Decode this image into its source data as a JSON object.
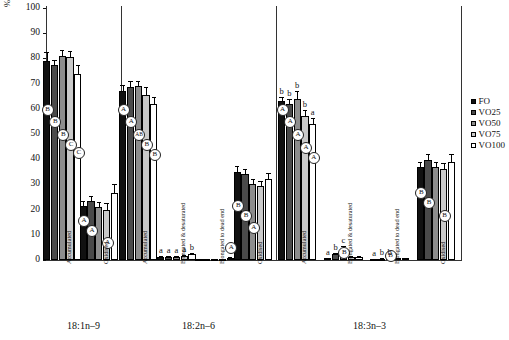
{
  "chart_data": {
    "type": "bar",
    "title": "",
    "xlabel": "",
    "ylabel": "% of relative net intake",
    "ylim": [
      0,
      100
    ],
    "yticks": [
      0,
      10,
      20,
      30,
      40,
      50,
      60,
      70,
      80,
      90,
      100
    ],
    "grid": false,
    "legend_position": "right",
    "legend": [
      "FO",
      "VO25",
      "VO50",
      "VO75",
      "VO100"
    ],
    "series_colors": {
      "FO": "#111111",
      "VO25": "#4a4a4a",
      "VO50": "#8d8d8d",
      "VO75": "#c9c9c9",
      "VO100": "#ffffff"
    },
    "group_labels": [
      "18:1n–9",
      "18:2n–6",
      "18:3n–3"
    ],
    "categories": [
      {
        "group": "18:1n–9",
        "label": "Accumulated"
      },
      {
        "group": "18:1n–9",
        "label": "Oxidised"
      },
      {
        "group": "18:2n–6",
        "label": "Accumulated"
      },
      {
        "group": "18:2n–6",
        "label": "Elongated & desaturated"
      },
      {
        "group": "18:2n–6",
        "label": "Elongated to dead end"
      },
      {
        "group": "18:2n–6",
        "label": "Oxidised"
      },
      {
        "group": "18:3n–3",
        "label": "Accumulated"
      },
      {
        "group": "18:3n–3",
        "label": "Elongated & desaturated"
      },
      {
        "group": "18:3n–3",
        "label": "Elongated to dead end"
      },
      {
        "group": "18:3n–3",
        "label": "Oxidised"
      }
    ],
    "series": [
      {
        "name": "FO",
        "values": [
          79.0,
          21.5,
          67.0,
          1.2,
          0.3,
          35.0,
          63.0,
          0.6,
          0.3,
          37.0
        ]
      },
      {
        "name": "VO25",
        "values": [
          77.5,
          23.5,
          68.5,
          1.3,
          0.3,
          34.0,
          62.0,
          2.2,
          0.5,
          39.5
        ]
      },
      {
        "name": "VO50",
        "values": [
          81.0,
          21.0,
          69.0,
          1.3,
          0.3,
          30.0,
          64.0,
          4.5,
          0.6,
          37.0
        ]
      },
      {
        "name": "VO75",
        "values": [
          80.5,
          20.0,
          65.5,
          1.4,
          0.3,
          29.5,
          57.0,
          1.0,
          0.6,
          36.0
        ]
      },
      {
        "name": "VO100",
        "values": [
          74.0,
          26.5,
          62.0,
          2.2,
          0.8,
          32.0,
          54.0,
          1.0,
          0.6,
          39.0
        ]
      }
    ],
    "errors": [
      {
        "name": "FO",
        "values": [
          3.5,
          2.0,
          2.5,
          0.4,
          0.1,
          2.5,
          1.5,
          0.3,
          0.1,
          2.0
        ]
      },
      {
        "name": "VO25",
        "values": [
          2.0,
          2.0,
          2.5,
          0.4,
          0.1,
          2.0,
          2.0,
          0.6,
          0.2,
          2.5
        ]
      },
      {
        "name": "VO50",
        "values": [
          2.5,
          2.0,
          2.0,
          0.4,
          0.1,
          2.0,
          3.0,
          1.2,
          0.2,
          2.0
        ]
      },
      {
        "name": "VO75",
        "values": [
          2.5,
          2.5,
          3.0,
          0.4,
          0.1,
          2.0,
          2.5,
          0.4,
          0.2,
          2.5
        ]
      },
      {
        "name": "VO100",
        "values": [
          3.5,
          3.5,
          2.5,
          0.5,
          0.2,
          2.5,
          2.5,
          0.4,
          0.2,
          3.0
        ]
      }
    ],
    "circle_annotations": [
      {
        "category": 0,
        "marks": [
          {
            "series": "FO",
            "text": "B",
            "y": 60
          },
          {
            "series": "VO25",
            "text": "B",
            "y": 55
          },
          {
            "series": "VO50",
            "text": "B",
            "y": 50
          },
          {
            "series": "VO75",
            "text": "C",
            "y": 46
          },
          {
            "series": "VO100",
            "text": "C",
            "y": 43
          }
        ]
      },
      {
        "category": 1,
        "marks": [
          {
            "series": "FO",
            "text": "A",
            "y": 16
          },
          {
            "series": "VO25",
            "text": "A",
            "y": 12
          },
          {
            "series": "VO50",
            "text": "",
            "y": 0
          },
          {
            "series": "VO75",
            "text": "A",
            "y": 7
          },
          {
            "series": "VO100",
            "text": "",
            "y": 0
          }
        ]
      },
      {
        "category": 2,
        "marks": [
          {
            "series": "FO",
            "text": "A",
            "y": 60
          },
          {
            "series": "VO25",
            "text": "A",
            "y": 55
          },
          {
            "series": "VO50",
            "text": "AB",
            "y": 50
          },
          {
            "series": "VO75",
            "text": "B",
            "y": 46
          },
          {
            "series": "VO100",
            "text": "B",
            "y": 42
          }
        ]
      },
      {
        "category": 4,
        "marks": [
          {
            "series": "VO100",
            "text": "A",
            "y": 5
          }
        ]
      },
      {
        "category": 5,
        "marks": [
          {
            "series": "FO",
            "text": "B",
            "y": 22
          },
          {
            "series": "VO25",
            "text": "B",
            "y": 18
          },
          {
            "series": "VO50",
            "text": "A",
            "y": 13
          }
        ]
      },
      {
        "category": 6,
        "marks": [
          {
            "series": "FO",
            "text": "A",
            "y": 60
          },
          {
            "series": "VO25",
            "text": "A",
            "y": 55
          },
          {
            "series": "VO50",
            "text": "A",
            "y": 50
          },
          {
            "series": "VO75",
            "text": "A",
            "y": 45
          },
          {
            "series": "VO100",
            "text": "A",
            "y": 41
          }
        ]
      },
      {
        "category": 7,
        "marks": [
          {
            "series": "VO50",
            "text": "B",
            "y": 3
          }
        ]
      },
      {
        "category": 8,
        "marks": [
          {
            "series": "VO50",
            "text": "B",
            "y": 2
          }
        ]
      },
      {
        "category": 9,
        "marks": [
          {
            "series": "FO",
            "text": "B",
            "y": 27
          },
          {
            "series": "VO25",
            "text": "B",
            "y": 23
          },
          {
            "series": "VO75",
            "text": "B",
            "y": 18
          }
        ]
      }
    ],
    "letter_annotations": [
      {
        "category": 3,
        "letters": [
          "a",
          "a",
          "a",
          "a",
          "b"
        ]
      },
      {
        "category": 6,
        "letters": [
          "b",
          "b",
          "b",
          "b",
          "a"
        ]
      },
      {
        "category": 7,
        "letters": [
          "a",
          "b",
          "c",
          "",
          ""
        ]
      },
      {
        "category": 8,
        "letters": [
          "a",
          "b",
          "b",
          "",
          ""
        ]
      }
    ]
  }
}
